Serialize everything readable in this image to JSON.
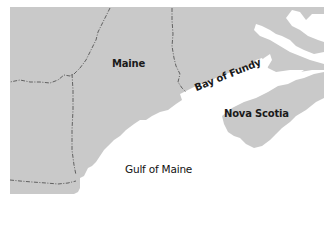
{
  "map": {
    "colors": {
      "land": "#c9c9c9",
      "water": "#ffffff",
      "border": "#555555"
    },
    "labels": {
      "maine": "Maine",
      "bay_of_fundy": "Bay of Fundy",
      "nova_scotia": "Nova Scotia",
      "gulf_of_maine": "Gulf of Maine"
    }
  }
}
